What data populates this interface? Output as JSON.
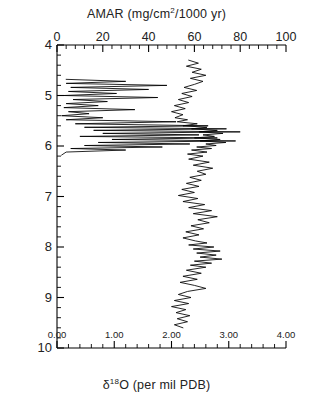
{
  "figure": {
    "top_axis_title_parts": {
      "pre": "AMAR  (mg/cm",
      "sup": "2",
      "post": "/1000  yr)"
    },
    "bottom_axis_title_parts": {
      "pre": "δ",
      "sup": "18",
      "post": "O  (per mil PDB)"
    },
    "y_axis_title": "Age  (Ma)"
  },
  "chart_data": {
    "type": "line",
    "title": "AMAR (mg/cm2/1000 yr)",
    "xlabel": "δ18O (per mil PDB)",
    "xlabel_top": "AMAR (mg/cm2/1000 yr)",
    "ylabel": "Age (Ma)",
    "ylim": [
      10.0,
      4.0
    ],
    "y_inverted": true,
    "grid": false,
    "legend": "none",
    "axes": {
      "bottom": {
        "name": "d18O",
        "label": "δ18O  (per mil PDB)",
        "min": 0.0,
        "max": 4.0,
        "ticks": [
          0.0,
          1.0,
          2.0,
          3.0,
          4.0
        ],
        "tick_labels": [
          "0.00",
          "1.00",
          "2.00",
          "3.00",
          "4.00"
        ],
        "minor_per_major": 5
      },
      "top": {
        "name": "AMAR",
        "label": "AMAR  (mg/cm2/1000 yr)",
        "min": 0,
        "max": 100,
        "ticks": [
          0,
          20,
          40,
          60,
          80,
          100
        ],
        "tick_labels": [
          "0",
          "20",
          "40",
          "60",
          "80",
          "100"
        ],
        "minor_per_major": 5
      },
      "left": {
        "name": "Age",
        "label": "Age  (Ma)",
        "min": 4,
        "max": 10,
        "ticks": [
          4,
          5,
          6,
          7,
          8,
          9,
          10
        ],
        "tick_labels": [
          "4",
          "5",
          "6",
          "7",
          "8",
          "9",
          "10"
        ],
        "minor_per_major": 5
      }
    },
    "series": [
      {
        "name": "d18O",
        "axis": "bottom",
        "units": "per mil PDB",
        "color": "#000000",
        "points": [
          [
            2.3,
            4.3
          ],
          [
            2.47,
            4.36
          ],
          [
            2.26,
            4.42
          ],
          [
            2.52,
            4.48
          ],
          [
            2.36,
            4.54
          ],
          [
            2.6,
            4.6
          ],
          [
            2.33,
            4.66
          ],
          [
            2.55,
            4.72
          ],
          [
            2.4,
            4.78
          ],
          [
            2.22,
            4.84
          ],
          [
            2.44,
            4.9
          ],
          [
            2.18,
            4.96
          ],
          [
            2.36,
            5.02
          ],
          [
            2.12,
            5.08
          ],
          [
            2.3,
            5.14
          ],
          [
            2.05,
            5.2
          ],
          [
            2.24,
            5.26
          ],
          [
            2.0,
            5.32
          ],
          [
            2.2,
            5.38
          ],
          [
            2.06,
            5.44
          ],
          [
            2.28,
            5.48
          ],
          [
            2.1,
            5.52
          ],
          [
            2.45,
            5.56
          ],
          [
            2.2,
            5.6
          ],
          [
            2.62,
            5.63
          ],
          [
            2.35,
            5.66
          ],
          [
            2.8,
            5.69
          ],
          [
            2.48,
            5.72
          ],
          [
            2.9,
            5.75
          ],
          [
            2.55,
            5.78
          ],
          [
            2.75,
            5.81
          ],
          [
            2.4,
            5.84
          ],
          [
            2.85,
            5.87
          ],
          [
            2.5,
            5.9
          ],
          [
            2.95,
            5.93
          ],
          [
            2.6,
            5.96
          ],
          [
            2.78,
            5.99
          ],
          [
            2.44,
            6.02
          ],
          [
            2.7,
            6.05
          ],
          [
            2.35,
            6.08
          ],
          [
            2.62,
            6.12
          ],
          [
            2.28,
            6.16
          ],
          [
            2.55,
            6.2
          ],
          [
            2.3,
            6.26
          ],
          [
            2.66,
            6.32
          ],
          [
            2.38,
            6.38
          ],
          [
            2.72,
            6.44
          ],
          [
            2.45,
            6.5
          ],
          [
            2.6,
            6.56
          ],
          [
            2.32,
            6.62
          ],
          [
            2.52,
            6.68
          ],
          [
            2.26,
            6.74
          ],
          [
            2.48,
            6.8
          ],
          [
            2.18,
            6.86
          ],
          [
            2.4,
            6.92
          ],
          [
            2.12,
            6.98
          ],
          [
            2.46,
            7.04
          ],
          [
            2.2,
            7.1
          ],
          [
            2.58,
            7.16
          ],
          [
            2.3,
            7.22
          ],
          [
            2.7,
            7.28
          ],
          [
            2.38,
            7.34
          ],
          [
            2.8,
            7.4
          ],
          [
            2.46,
            7.46
          ],
          [
            2.66,
            7.52
          ],
          [
            2.34,
            7.58
          ],
          [
            2.56,
            7.64
          ],
          [
            2.25,
            7.7
          ],
          [
            2.48,
            7.76
          ],
          [
            2.2,
            7.82
          ],
          [
            2.42,
            7.88
          ],
          [
            2.62,
            7.92
          ],
          [
            2.3,
            7.96
          ],
          [
            2.74,
            8.0
          ],
          [
            2.38,
            8.04
          ],
          [
            2.85,
            8.08
          ],
          [
            2.44,
            8.12
          ],
          [
            2.78,
            8.16
          ],
          [
            2.5,
            8.2
          ],
          [
            2.88,
            8.24
          ],
          [
            2.4,
            8.28
          ],
          [
            2.7,
            8.32
          ],
          [
            2.33,
            8.36
          ],
          [
            2.6,
            8.4
          ],
          [
            2.26,
            8.46
          ],
          [
            2.52,
            8.52
          ],
          [
            2.2,
            8.58
          ],
          [
            2.45,
            8.64
          ],
          [
            2.15,
            8.7
          ],
          [
            2.4,
            8.76
          ],
          [
            2.6,
            8.82
          ],
          [
            2.28,
            8.88
          ],
          [
            2.12,
            8.94
          ],
          [
            2.34,
            9.0
          ],
          [
            2.05,
            9.06
          ],
          [
            2.3,
            9.12
          ],
          [
            2.0,
            9.18
          ],
          [
            2.25,
            9.24
          ],
          [
            2.08,
            9.3
          ],
          [
            2.32,
            9.36
          ],
          [
            2.1,
            9.42
          ],
          [
            2.28,
            9.48
          ],
          [
            2.05,
            9.54
          ],
          [
            2.2,
            9.6
          ]
        ]
      },
      {
        "name": "AMAR",
        "axis": "top",
        "units": "mg/cm2/1000 yr",
        "color": "#000000",
        "points": [
          [
            4,
            4.68
          ],
          [
            30,
            4.72
          ],
          [
            4,
            4.76
          ],
          [
            48,
            4.8
          ],
          [
            6,
            4.84
          ],
          [
            40,
            4.88
          ],
          [
            5,
            4.92
          ],
          [
            26,
            4.96
          ],
          [
            3,
            5.0
          ],
          [
            44,
            5.04
          ],
          [
            7,
            5.08
          ],
          [
            22,
            5.12
          ],
          [
            4,
            5.16
          ],
          [
            18,
            5.2
          ],
          [
            3,
            5.24
          ],
          [
            34,
            5.28
          ],
          [
            5,
            5.32
          ],
          [
            14,
            5.36
          ],
          [
            2,
            5.4
          ],
          [
            20,
            5.44
          ],
          [
            4,
            5.48
          ],
          [
            52,
            5.52
          ],
          [
            8,
            5.56
          ],
          [
            66,
            5.6
          ],
          [
            12,
            5.63
          ],
          [
            74,
            5.66
          ],
          [
            16,
            5.69
          ],
          [
            80,
            5.72
          ],
          [
            20,
            5.75
          ],
          [
            62,
            5.78
          ],
          [
            10,
            5.81
          ],
          [
            70,
            5.84
          ],
          [
            24,
            5.87
          ],
          [
            78,
            5.9
          ],
          [
            18,
            5.93
          ],
          [
            58,
            5.96
          ],
          [
            12,
            5.99
          ],
          [
            46,
            6.02
          ],
          [
            6,
            6.05
          ],
          [
            30,
            6.08
          ],
          [
            4,
            6.12
          ],
          [
            2,
            6.18
          ]
        ]
      }
    ]
  }
}
